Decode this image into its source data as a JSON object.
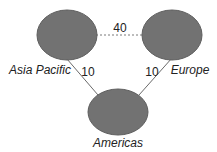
{
  "diagram": {
    "type": "network-graph",
    "colors": {
      "node_fill": "#727272",
      "node_stroke": "#5e5e5e",
      "edge_solid": "#6a6a6a",
      "edge_dashed": "#7a7a7a",
      "text": "#222222"
    },
    "nodes": [
      {
        "id": "asia_pacific",
        "label": "Asia Pacific",
        "cx": 67,
        "cy": 35,
        "rx": 30,
        "ry": 25
      },
      {
        "id": "europe",
        "label": "Europe",
        "cx": 172,
        "cy": 35,
        "rx": 30,
        "ry": 25
      },
      {
        "id": "americas",
        "label": "Americas",
        "cx": 118,
        "cy": 112,
        "rx": 30,
        "ry": 23
      }
    ],
    "edges": [
      {
        "from": "asia_pacific",
        "to": "europe",
        "label": "40",
        "style": "dashed"
      },
      {
        "from": "asia_pacific",
        "to": "americas",
        "label": "10",
        "style": "solid"
      },
      {
        "from": "europe",
        "to": "americas",
        "label": "10",
        "style": "solid"
      }
    ]
  }
}
